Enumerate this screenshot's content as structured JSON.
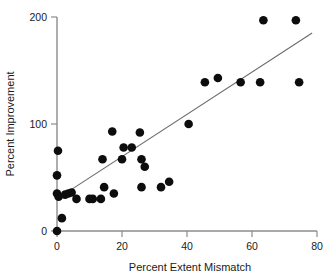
{
  "chart_data": {
    "type": "scatter",
    "title": "",
    "xlabel": "Percent Extent Mismatch",
    "ylabel": "Percent Improvement",
    "xlim": [
      0,
      80
    ],
    "ylim": [
      0,
      200
    ],
    "xticks": [
      0,
      20,
      40,
      60,
      80
    ],
    "yticks": [
      0,
      100,
      200
    ],
    "xtick_labels": [
      "0",
      "20",
      "40",
      "60",
      "80"
    ],
    "ytick_labels": [
      "0",
      "100",
      "200"
    ],
    "grid": false,
    "legend": null,
    "marker_color": "#0d0d0d",
    "marker_size": 4.3,
    "axis_color": "#8c8c8c",
    "points": [
      {
        "x": 0.0,
        "y": 0
      },
      {
        "x": 0.0,
        "y": 35
      },
      {
        "x": 0.0,
        "y": 52
      },
      {
        "x": 0.3,
        "y": 75
      },
      {
        "x": 1.5,
        "y": 12
      },
      {
        "x": 0.5,
        "y": 32
      },
      {
        "x": 2.5,
        "y": 34
      },
      {
        "x": 3.5,
        "y": 35
      },
      {
        "x": 4.5,
        "y": 36
      },
      {
        "x": 6.0,
        "y": 30
      },
      {
        "x": 10.0,
        "y": 30
      },
      {
        "x": 11.0,
        "y": 30
      },
      {
        "x": 13.5,
        "y": 30
      },
      {
        "x": 14.0,
        "y": 67
      },
      {
        "x": 14.5,
        "y": 41
      },
      {
        "x": 17.0,
        "y": 93
      },
      {
        "x": 17.5,
        "y": 35
      },
      {
        "x": 20.0,
        "y": 67
      },
      {
        "x": 20.5,
        "y": 78
      },
      {
        "x": 23.0,
        "y": 78
      },
      {
        "x": 25.5,
        "y": 92
      },
      {
        "x": 26.0,
        "y": 67
      },
      {
        "x": 26.0,
        "y": 41
      },
      {
        "x": 27.0,
        "y": 60
      },
      {
        "x": 32.0,
        "y": 41
      },
      {
        "x": 34.5,
        "y": 46
      },
      {
        "x": 40.5,
        "y": 100
      },
      {
        "x": 45.5,
        "y": 139
      },
      {
        "x": 49.5,
        "y": 143
      },
      {
        "x": 56.5,
        "y": 139
      },
      {
        "x": 62.5,
        "y": 139
      },
      {
        "x": 63.5,
        "y": 197
      },
      {
        "x": 74.5,
        "y": 139
      },
      {
        "x": 73.5,
        "y": 197
      }
    ],
    "fit_line": {
      "x0": 0.0,
      "y0": 30.0,
      "x1": 78.5,
      "y1": 185.0,
      "color": "#6b6b6b"
    }
  }
}
